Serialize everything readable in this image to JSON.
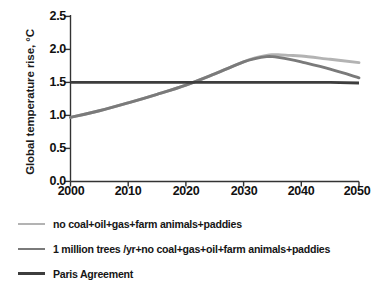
{
  "chart_data": {
    "type": "line",
    "title": "",
    "xlabel": "",
    "ylabel": "Global temperature rise, °C",
    "xlim": [
      2000,
      2050
    ],
    "ylim": [
      0.0,
      2.5
    ],
    "grid": false,
    "legend_position": "below",
    "xticks": [
      "2000",
      "2010",
      "2020",
      "2030",
      "2040",
      "2050"
    ],
    "yticks": [
      "0.0",
      "0.5",
      "1.0",
      "1.5",
      "2.0",
      "2.5"
    ],
    "x": [
      2000,
      2005,
      2010,
      2015,
      2020,
      2025,
      2030,
      2032,
      2034,
      2035,
      2036,
      2038,
      2040,
      2045,
      2050
    ],
    "series": [
      {
        "name": "no coal+oil+gas+farm animals+paddies",
        "color": "#b3b3b3",
        "values": [
          0.97,
          1.07,
          1.19,
          1.32,
          1.46,
          1.63,
          1.81,
          1.87,
          1.91,
          1.92,
          1.92,
          1.91,
          1.9,
          1.85,
          1.8
        ]
      },
      {
        "name": "1 million trees /yr+no coal+gas+oil+farm animals+paddies",
        "color": "#7a7a7a",
        "values": [
          0.97,
          1.07,
          1.19,
          1.32,
          1.46,
          1.63,
          1.81,
          1.86,
          1.89,
          1.89,
          1.88,
          1.85,
          1.81,
          1.7,
          1.57
        ]
      },
      {
        "name": "Paris Agreement",
        "color": "#3d3d3d",
        "values": [
          1.5,
          1.5,
          1.5,
          1.5,
          1.5,
          1.5,
          1.5,
          1.5,
          1.5,
          1.5,
          1.5,
          1.5,
          1.5,
          1.5,
          1.49
        ]
      }
    ],
    "annotations": {
      "paris_crossing_year": 2021.5,
      "peak_year": 2035,
      "peak_value": 1.92
    }
  },
  "legend": {
    "items": [
      {
        "label": "no coal+oil+gas+farm animals+paddies",
        "color": "#b3b3b3"
      },
      {
        "label": "1 million trees /yr+no coal+gas+oil+farm animals+paddies",
        "color": "#7a7a7a"
      },
      {
        "label": "Paris Agreement",
        "color": "#3d3d3d"
      }
    ]
  },
  "axes": {
    "y_title": "Global temperature rise, °C",
    "y_labels": [
      "2.5",
      "2.0",
      "1.5",
      "1.0",
      "0.5",
      "0.0"
    ],
    "x_labels": [
      "2000",
      "2010",
      "2020",
      "2030",
      "2040",
      "2050"
    ]
  },
  "colors": {
    "axis": "#333333",
    "text": "#111111",
    "background": "#ffffff"
  }
}
